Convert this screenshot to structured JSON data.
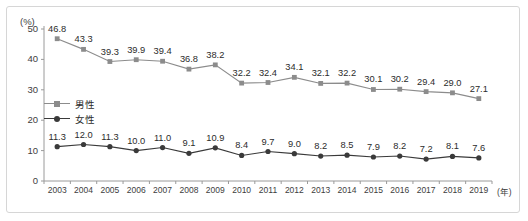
{
  "chart_data": {
    "type": "line",
    "title": "",
    "xlabel": "(年)",
    "ylabel": "(%)",
    "x": [
      "2003",
      "2004",
      "2005",
      "2006",
      "2007",
      "2008",
      "2009",
      "2010",
      "2011",
      "2012",
      "2013",
      "2014",
      "2015",
      "2016",
      "2017",
      "2018",
      "2019"
    ],
    "categories": [
      "2003",
      "2004",
      "2005",
      "2006",
      "2007",
      "2008",
      "2009",
      "2010",
      "2011",
      "2012",
      "2013",
      "2014",
      "2015",
      "2016",
      "2017",
      "2018",
      "2019"
    ],
    "ylim": [
      0,
      50
    ],
    "yticks": [
      0,
      10,
      20,
      30,
      40,
      50
    ],
    "ytick_labels": [
      "0",
      "10",
      "20",
      "30",
      "40",
      "50"
    ],
    "grid": false,
    "legend_position": "inside-left",
    "series": [
      {
        "name": "男性",
        "color": "#8c8c8c",
        "marker": "square",
        "values": [
          46.8,
          43.3,
          39.3,
          39.9,
          39.4,
          36.8,
          38.2,
          32.2,
          32.4,
          34.1,
          32.1,
          32.2,
          30.1,
          30.2,
          29.4,
          29.0,
          27.1
        ],
        "labels": [
          "46.8",
          "43.3",
          "39.3",
          "39.9",
          "39.4",
          "36.8",
          "38.2",
          "32.2",
          "32.4",
          "34.1",
          "32.1",
          "32.2",
          "30.1",
          "30.2",
          "29.4",
          "29.0",
          "27.1"
        ]
      },
      {
        "name": "女性",
        "color": "#3a3a3a",
        "marker": "circle",
        "values": [
          11.3,
          12.0,
          11.3,
          10.0,
          11.0,
          9.1,
          10.9,
          8.4,
          9.7,
          9.0,
          8.2,
          8.5,
          7.9,
          8.2,
          7.2,
          8.1,
          7.6
        ],
        "labels": [
          "11.3",
          "12.0",
          "11.3",
          "10.0",
          "11.0",
          "9.1",
          "10.9",
          "8.4",
          "9.7",
          "9.0",
          "8.2",
          "8.5",
          "7.9",
          "8.2",
          "7.2",
          "8.1",
          "7.6"
        ]
      }
    ]
  },
  "axes": {
    "y_unit": "(%)",
    "x_unit": "(年)"
  },
  "legend": {
    "items": [
      {
        "label": "男性"
      },
      {
        "label": "女性"
      }
    ]
  },
  "colors": {
    "male_line": "#8c8c8c",
    "female_line": "#3a3a3a",
    "axis": "#9a9a9a",
    "frame": "#d6d6d6",
    "text": "#2b2b2b"
  }
}
